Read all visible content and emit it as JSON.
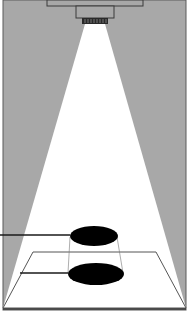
{
  "diagram": {
    "title": "Lamp light cone projecting an object's shadow onto a plane",
    "colors": {
      "background": "#a8a8a8",
      "beam": "#ffffff",
      "outline": "#3a3a3a",
      "ellipse": "#000000",
      "frame": "#5a5a5a"
    },
    "elements": [
      {
        "id": "ceiling-bar",
        "label": "ceiling bar"
      },
      {
        "id": "lamp-housing",
        "label": "lamp housing"
      },
      {
        "id": "lamp-grille",
        "label": "lamp grille"
      },
      {
        "id": "light-cone",
        "label": "light cone"
      },
      {
        "id": "object-disc",
        "label": "object"
      },
      {
        "id": "shadow-disc",
        "label": "shadow"
      },
      {
        "id": "floor-plane",
        "label": "projection plane"
      },
      {
        "id": "leader-object",
        "label": "object pointer"
      },
      {
        "id": "leader-shadow",
        "label": "shadow pointer"
      }
    ]
  }
}
